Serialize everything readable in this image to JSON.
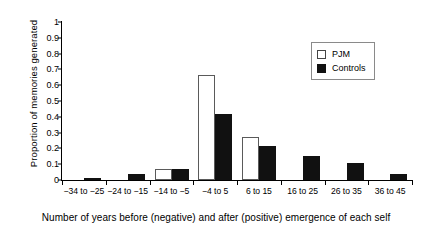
{
  "chart_data": {
    "type": "bar",
    "title": "",
    "xlabel": "Number of years before (negative) and after (positive) emergence of each self",
    "ylabel": "Proportion of memories generated",
    "categories": [
      "−34 to −25",
      "−24 to −15",
      "−14 to −5",
      "−4 to 5",
      "6 to 15",
      "16 to 25",
      "26 to 35",
      "36 to 45"
    ],
    "series": [
      {
        "name": "PJM",
        "values": [
          0,
          0,
          0.07,
          0.665,
          0.275,
          0,
          0,
          0
        ]
      },
      {
        "name": "Controls",
        "values": [
          0.005,
          0.038,
          0.07,
          0.415,
          0.215,
          0.155,
          0.105,
          0.04
        ]
      }
    ],
    "ylim": [
      0,
      1
    ],
    "yticks": [
      "0",
      "0.1",
      "0.2",
      "0.3",
      "0.4",
      "0.5",
      "0.6",
      "0.7",
      "0.8",
      "0.9",
      "1"
    ],
    "ytick_values": [
      0,
      0.1,
      0.2,
      0.3,
      0.4,
      0.5,
      0.6,
      0.7,
      0.8,
      0.9,
      1
    ],
    "grid": false,
    "legend_position": "top-right",
    "colors": {
      "pjm": "#ffffff",
      "controls": "#111111",
      "axis": "#000000"
    }
  },
  "legend": {
    "items": [
      {
        "label": "PJM",
        "style": "open"
      },
      {
        "label": "Controls",
        "style": "filled"
      }
    ]
  }
}
